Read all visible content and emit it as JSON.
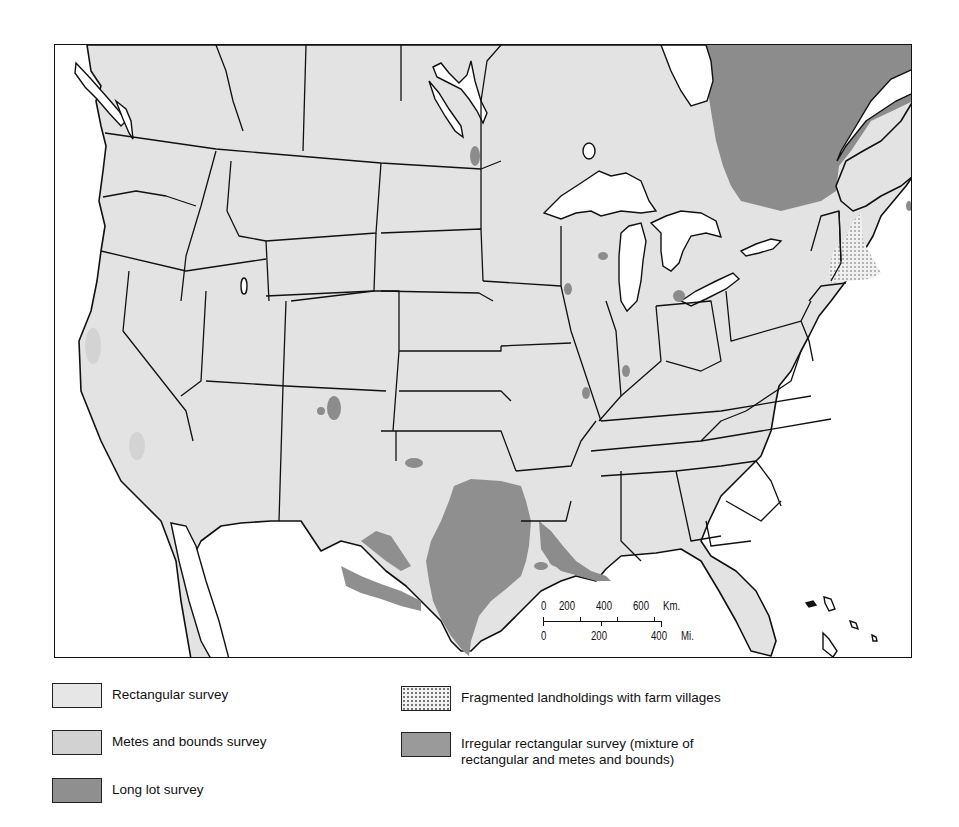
{
  "map": {
    "title": "Land survey systems of the United States",
    "region": "Conterminous United States with southern Canada and northern Mexico",
    "scale_bar": {
      "km_ticks": [
        "0",
        "200",
        "400",
        "600"
      ],
      "km_unit": "Km.",
      "mi_ticks": [
        "0",
        "200",
        "400"
      ],
      "mi_unit": "Mi."
    },
    "colors": {
      "rectangular": "#e3e3e3",
      "metes_and_bounds": "#d3d3d3",
      "long_lot": "#8c8c8c",
      "irregular_rectangular": "#8f8f8f",
      "fragmented": "#f2f2f2",
      "water": "#ffffff",
      "boundary": "#111111"
    }
  },
  "legend": {
    "items": [
      {
        "id": "rectangular",
        "label": "Rectangular survey",
        "swatch": "light-gray"
      },
      {
        "id": "metes",
        "label": "Metes and bounds survey",
        "swatch": "medium-light-gray"
      },
      {
        "id": "longlot",
        "label": "Long lot survey",
        "swatch": "dark-gray"
      },
      {
        "id": "fragmented",
        "label": "Fragmented landholdings with farm villages",
        "swatch": "dotted"
      },
      {
        "id": "irregular",
        "label": "Irregular rectangular survey (mixture of",
        "label_line2": "rectangular and metes and bounds)",
        "swatch": "dark-gray"
      }
    ]
  }
}
